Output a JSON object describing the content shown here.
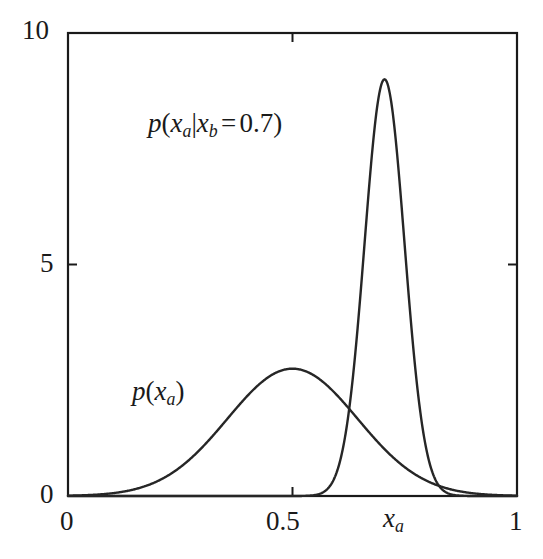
{
  "figure": {
    "name": "gaussian-marginal-conditional-plot",
    "background_color": "#ffffff",
    "line_color": "#262626",
    "axis_color": "#1a1a1a"
  },
  "axes": {
    "x": {
      "label": "x",
      "label_sub": "a",
      "min": 0,
      "max": 1,
      "ticks": [
        {
          "value": 0,
          "label": "0"
        },
        {
          "value": 0.5,
          "label": "0.5"
        },
        {
          "value": 1,
          "label": "1"
        }
      ]
    },
    "y": {
      "label": "",
      "min": 0,
      "max": 10,
      "ticks": [
        {
          "value": 0,
          "label": "0"
        },
        {
          "value": 5,
          "label": "5"
        },
        {
          "value": 10,
          "label": "10"
        }
      ]
    }
  },
  "annotations": {
    "marginal": {
      "p": "p",
      "open": "(",
      "x": "x",
      "sub": "a",
      "close": ")"
    },
    "conditional": {
      "p": "p",
      "open": "(",
      "x1": "x",
      "sub1": "a",
      "bar": "|",
      "x2": "x",
      "sub2": "b",
      "eq": "=",
      "value": "0.7",
      "close": ")"
    }
  },
  "chart_data": {
    "type": "line",
    "title": "",
    "xlabel": "x_a",
    "ylabel": "",
    "xlim": [
      0,
      1
    ],
    "ylim": [
      0,
      10
    ],
    "grid": false,
    "legend": "none",
    "annotations": [
      {
        "text": "p(x_a|x_b = 0.7)",
        "x": 0.28,
        "y": 7.4
      },
      {
        "text": "p(x_a)",
        "x": 0.2,
        "y": 2.4
      }
    ],
    "series": [
      {
        "name": "p(x_a)",
        "distribution": "gaussian",
        "mean": 0.5,
        "sigma": 0.145,
        "peak_value": 2.75,
        "x": [
          0.0,
          0.05,
          0.1,
          0.15,
          0.2,
          0.25,
          0.3,
          0.35,
          0.4,
          0.45,
          0.5,
          0.55,
          0.6,
          0.65,
          0.7,
          0.75,
          0.8,
          0.85,
          0.9,
          0.95,
          1.0
        ],
        "values": [
          0.01,
          0.04,
          0.13,
          0.35,
          0.79,
          1.45,
          2.15,
          2.61,
          2.75,
          2.71,
          2.75,
          2.71,
          2.15,
          1.45,
          0.79,
          0.35,
          0.13,
          0.04,
          0.01,
          0.0,
          0.0
        ]
      },
      {
        "name": "p(x_a|x_b = 0.7)",
        "distribution": "gaussian",
        "mean": 0.705,
        "sigma": 0.0445,
        "peak_value": 9.0,
        "x": [
          0.5,
          0.55,
          0.58,
          0.6,
          0.62,
          0.64,
          0.66,
          0.68,
          0.7,
          0.705,
          0.72,
          0.74,
          0.76,
          0.78,
          0.8,
          0.82,
          0.85,
          0.9,
          0.95,
          1.0
        ],
        "values": [
          0.0,
          0.02,
          0.09,
          0.27,
          0.68,
          1.49,
          2.86,
          4.8,
          8.4,
          9.0,
          8.09,
          5.62,
          3.18,
          1.47,
          0.56,
          0.17,
          0.02,
          0.0,
          0.0,
          0.0
        ]
      }
    ]
  }
}
